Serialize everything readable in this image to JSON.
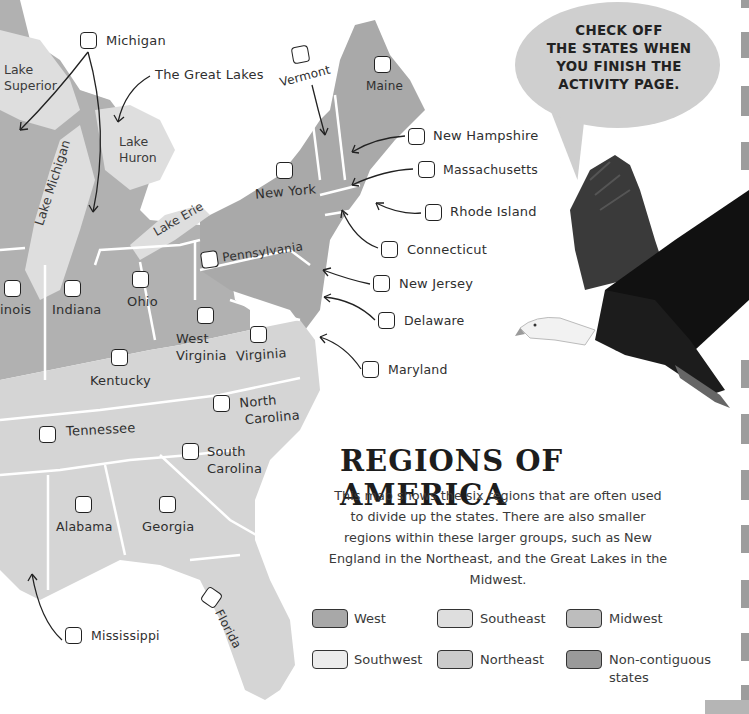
{
  "map": {
    "lakes": {
      "superior": "Lake\nSuperior",
      "superior_line1": "Lake",
      "superior_line2": "Superior",
      "huron_line1": "Lake",
      "huron_line2": "Huron",
      "michigan": "Lake Michigan",
      "erie": "Lake Erie"
    },
    "great_lakes_label": "The Great Lakes",
    "states": [
      {
        "name": "Michigan",
        "checked": false
      },
      {
        "name": "Vermont",
        "checked": false
      },
      {
        "name": "Maine",
        "checked": false
      },
      {
        "name": "New Hampshire",
        "checked": false
      },
      {
        "name": "Massachusetts",
        "checked": false
      },
      {
        "name": "New York",
        "checked": false
      },
      {
        "name": "Rhode Island",
        "checked": false
      },
      {
        "name": "Connecticut",
        "checked": false
      },
      {
        "name": "Pennsylvania",
        "checked": false
      },
      {
        "name": "New Jersey",
        "checked": false
      },
      {
        "name": "Delaware",
        "checked": false
      },
      {
        "name": "Maryland",
        "checked": false
      },
      {
        "name": "Illinois",
        "display": "inois",
        "checked": false
      },
      {
        "name": "Indiana",
        "checked": false
      },
      {
        "name": "Ohio",
        "checked": false
      },
      {
        "name": "West Virginia",
        "line1": "West",
        "line2": "Virginia",
        "checked": false
      },
      {
        "name": "Virginia",
        "checked": false
      },
      {
        "name": "Kentucky",
        "checked": false
      },
      {
        "name": "North Carolina",
        "line1": "North",
        "line2": "Carolina",
        "checked": false
      },
      {
        "name": "Tennessee",
        "checked": false
      },
      {
        "name": "South Carolina",
        "line1": "South",
        "line2": "Carolina",
        "checked": false
      },
      {
        "name": "Alabama",
        "checked": false
      },
      {
        "name": "Georgia",
        "checked": false
      },
      {
        "name": "Florida",
        "checked": false
      },
      {
        "name": "Mississippi",
        "checked": false
      }
    ]
  },
  "callout": {
    "line1": "CHECK OFF",
    "line2": "THE STATES WHEN",
    "line3": "YOU FINISH THE",
    "line4": "ACTIVITY PAGE."
  },
  "info": {
    "title": "REGIONS OF AMERICA",
    "description": "This map shows the six regions that are often used to divide up the states. There are also smaller regions within these larger groups, such as New England in the Northeast, and the Great Lakes in the Midwest."
  },
  "legend": [
    {
      "label": "West",
      "color": "#a8a8a8"
    },
    {
      "label": "Southeast",
      "color": "#dedede"
    },
    {
      "label": "Midwest",
      "color": "#bdbdbd"
    },
    {
      "label": "Southwest",
      "color": "#e8e8e8"
    },
    {
      "label": "Northeast",
      "color": "#cbcbcb"
    },
    {
      "label": "Non-contiguous states",
      "color": "#9a9a9a"
    }
  ],
  "colors": {
    "northeast": "#a9a9a9",
    "midwest": "#b0b0b0",
    "southeast": "#d3d3d3",
    "lake": "#dcdcdc",
    "border": "#ffffff"
  }
}
